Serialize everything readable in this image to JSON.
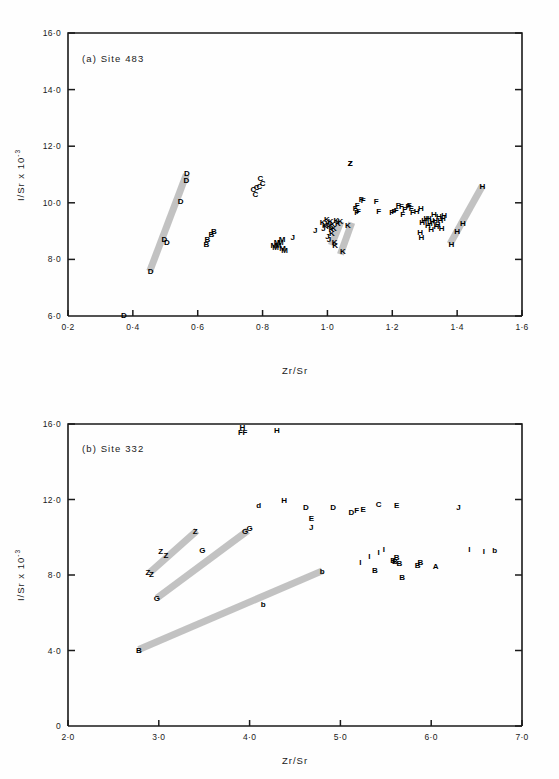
{
  "figure": {
    "background": "#ffffff",
    "ink": "#1a1a1a",
    "band_color": "#bdbdbd"
  },
  "panels": [
    {
      "id": "a",
      "title": "(a)  Site 483",
      "xlabel": "Zr/Sr",
      "ylabel_main": "I/Sr x 10",
      "ylabel_exp": "-3",
      "xticks": [
        "0·2",
        "0·4",
        "0·6",
        "0·8",
        "1·0",
        "1·2",
        "1·4",
        "1·6"
      ],
      "xtickvals": [
        0.2,
        0.4,
        0.6,
        0.8,
        1.0,
        1.2,
        1.4,
        1.6
      ],
      "yticks": [
        "6·0",
        "8·0",
        "10·0",
        "12·0",
        "14·0",
        "16·0"
      ],
      "ytickvals": [
        6,
        8,
        10,
        12,
        14,
        16
      ]
    },
    {
      "id": "b",
      "title": "(b)  Site 332",
      "xlabel": "Zr/Sr",
      "ylabel_main": "I/Sr x 10",
      "ylabel_exp": "-3",
      "xticks": [
        "2·0",
        "3·0",
        "4·0",
        "5·0",
        "6·0",
        "7·0"
      ],
      "xtickvals": [
        2,
        3,
        4,
        5,
        6,
        7
      ],
      "yticks": [
        "0",
        "4·0",
        "8·0",
        "12·0",
        "16·0"
      ],
      "ytickvals": [
        0,
        4,
        8,
        12,
        16
      ]
    }
  ],
  "chart_data": [
    {
      "type": "scatter",
      "title": "(a)  Site 483",
      "xlabel": "Zr/Sr",
      "ylabel": "I/Sr x 10^-3",
      "xlim": [
        0.2,
        1.6
      ],
      "ylim": [
        6.0,
        16.0
      ],
      "grid": false,
      "legend": "none",
      "marker_style": "letter-labels",
      "annotations": [
        {
          "label": "Z",
          "x": 1.07,
          "y": 11.42,
          "note": "isolated high point"
        }
      ],
      "bands": [
        {
          "name": "D-trend",
          "x1": 0.452,
          "y1": 7.58,
          "x2": 0.565,
          "y2": 11.0
        },
        {
          "name": "K-trend-1",
          "x1": 1.012,
          "y1": 8.5,
          "x2": 1.042,
          "y2": 9.35
        },
        {
          "name": "K-trend-2",
          "x1": 1.04,
          "y1": 8.18,
          "x2": 1.075,
          "y2": 9.3
        },
        {
          "name": "H-trend",
          "x1": 1.378,
          "y1": 8.55,
          "x2": 1.478,
          "y2": 10.6
        }
      ],
      "series": [
        {
          "name": "D",
          "points": [
            [
              0.455,
              7.58
            ],
            [
              0.497,
              8.72
            ],
            [
              0.505,
              8.62
            ],
            [
              0.547,
              10.05
            ],
            [
              0.565,
              10.82
            ],
            [
              0.567,
              11.05
            ],
            [
              0.372,
              6.02
            ]
          ]
        },
        {
          "name": "B",
          "points": [
            [
              0.627,
              8.55
            ],
            [
              0.63,
              8.72
            ],
            [
              0.642,
              8.88
            ],
            [
              0.65,
              9.0
            ]
          ]
        },
        {
          "name": "C",
          "points": [
            [
              0.772,
              10.48
            ],
            [
              0.778,
              10.3
            ],
            [
              0.782,
              10.55
            ],
            [
              0.79,
              10.58
            ],
            [
              0.793,
              10.88
            ],
            [
              0.8,
              10.7
            ]
          ]
        },
        {
          "name": "M",
          "points": [
            [
              0.835,
              8.52
            ],
            [
              0.84,
              8.45
            ],
            [
              0.845,
              8.6
            ],
            [
              0.848,
              8.5
            ],
            [
              0.855,
              8.62
            ],
            [
              0.86,
              8.72
            ],
            [
              0.862,
              8.4
            ],
            [
              0.868,
              8.33
            ]
          ]
        },
        {
          "name": "J",
          "points": [
            [
              0.893,
              8.8
            ],
            [
              0.962,
              9.05
            ],
            [
              0.988,
              9.12
            ],
            [
              1.0,
              8.82
            ],
            [
              1.005,
              8.72
            ]
          ]
        },
        {
          "name": "K",
          "points": [
            [
              0.985,
              9.32
            ],
            [
              0.992,
              9.2
            ],
            [
              0.998,
              9.42
            ],
            [
              1.002,
              9.3
            ],
            [
              1.006,
              9.18
            ],
            [
              1.01,
              9.35
            ],
            [
              1.012,
              9.08
            ],
            [
              1.014,
              8.95
            ],
            [
              1.016,
              9.25
            ],
            [
              1.02,
              9.12
            ],
            [
              1.022,
              8.62
            ],
            [
              1.024,
              8.52
            ],
            [
              1.028,
              9.38
            ],
            [
              1.032,
              9.3
            ],
            [
              1.04,
              9.35
            ],
            [
              1.048,
              8.28
            ],
            [
              1.063,
              9.22
            ]
          ]
        },
        {
          "name": "F",
          "points": [
            [
              1.086,
              9.8
            ],
            [
              1.09,
              9.68
            ],
            [
              1.092,
              9.92
            ],
            [
              1.096,
              9.72
            ],
            [
              1.104,
              10.12
            ],
            [
              1.11,
              10.1
            ],
            [
              1.15,
              10.08
            ],
            [
              1.158,
              9.72
            ],
            [
              1.198,
              9.68
            ],
            [
              1.205,
              9.7
            ],
            [
              1.212,
              9.75
            ],
            [
              1.218,
              9.92
            ],
            [
              1.228,
              9.88
            ],
            [
              1.232,
              9.62
            ],
            [
              1.238,
              9.78
            ],
            [
              1.248,
              9.88
            ],
            [
              1.252,
              9.92
            ],
            [
              1.258,
              9.8
            ],
            [
              1.262,
              9.68
            ]
          ]
        },
        {
          "name": "H",
          "points": [
            [
              1.275,
              9.7
            ],
            [
              1.288,
              9.82
            ],
            [
              1.292,
              9.32
            ],
            [
              1.298,
              9.38
            ],
            [
              1.305,
              9.45
            ],
            [
              1.31,
              9.22
            ],
            [
              1.312,
              9.48
            ],
            [
              1.316,
              9.28
            ],
            [
              1.32,
              9.08
            ],
            [
              1.324,
              9.35
            ],
            [
              1.328,
              9.62
            ],
            [
              1.332,
              9.4
            ],
            [
              1.336,
              9.18
            ],
            [
              1.34,
              9.25
            ],
            [
              1.344,
              9.52
            ],
            [
              1.348,
              9.4
            ],
            [
              1.352,
              9.12
            ],
            [
              1.356,
              9.45
            ],
            [
              1.36,
              9.58
            ],
            [
              1.286,
              8.98
            ],
            [
              1.29,
              8.78
            ],
            [
              1.382,
              8.55
            ],
            [
              1.4,
              9.0
            ],
            [
              1.418,
              9.28
            ],
            [
              1.478,
              10.6
            ]
          ]
        },
        {
          "name": "Z",
          "points": [
            [
              1.07,
              11.42
            ]
          ]
        }
      ]
    },
    {
      "type": "scatter",
      "title": "(b)  Site 332",
      "xlabel": "Zr/Sr",
      "ylabel": "I/Sr x 10^-3",
      "xlim": [
        2.0,
        7.0
      ],
      "ylim": [
        0,
        16.0
      ],
      "grid": false,
      "legend": "none",
      "marker_style": "letter-labels",
      "bands": [
        {
          "name": "Z-trend",
          "x1": 2.9,
          "y1": 8.12,
          "x2": 3.42,
          "y2": 10.35
        },
        {
          "name": "G-trend",
          "x1": 2.98,
          "y1": 6.78,
          "x2": 3.98,
          "y2": 10.35
        },
        {
          "name": "B-b-trend",
          "x1": 2.78,
          "y1": 4.05,
          "x2": 4.8,
          "y2": 8.22
        }
      ],
      "series": [
        {
          "name": "H",
          "points": [
            [
              3.92,
              15.85
            ],
            [
              4.3,
              15.7
            ]
          ]
        },
        {
          "name": "F",
          "points": [
            [
              3.9,
              15.55
            ],
            [
              3.95,
              15.58
            ]
          ]
        },
        {
          "name": "d",
          "points": [
            [
              4.1,
              11.7
            ]
          ]
        },
        {
          "name": "H2",
          "letter": "H",
          "points": [
            [
              4.38,
              12.0
            ]
          ]
        },
        {
          "name": "D",
          "points": [
            [
              4.62,
              11.62
            ],
            [
              4.92,
              11.58
            ],
            [
              5.12,
              11.35
            ]
          ]
        },
        {
          "name": "E",
          "points": [
            [
              4.68,
              11.02
            ],
            [
              5.25,
              11.52
            ],
            [
              5.62,
              11.7
            ]
          ]
        },
        {
          "name": "J",
          "points": [
            [
              4.68,
              10.55
            ],
            [
              6.3,
              11.58
            ]
          ]
        },
        {
          "name": "F2",
          "letter": "F",
          "points": [
            [
              5.18,
              11.45
            ]
          ]
        },
        {
          "name": "C",
          "points": [
            [
              5.42,
              11.78
            ]
          ]
        },
        {
          "name": "G",
          "points": [
            [
              2.98,
              6.78
            ],
            [
              3.48,
              9.3
            ],
            [
              3.95,
              10.32
            ],
            [
              4.0,
              10.48
            ]
          ]
        },
        {
          "name": "Z",
          "points": [
            [
              2.88,
              8.18
            ],
            [
              2.92,
              8.05
            ],
            [
              3.02,
              9.28
            ],
            [
              3.08,
              9.05
            ],
            [
              3.4,
              10.35
            ]
          ]
        },
        {
          "name": "B",
          "points": [
            [
              2.78,
              4.05
            ],
            [
              5.38,
              8.25
            ],
            [
              5.58,
              8.82
            ],
            [
              5.6,
              8.72
            ],
            [
              5.62,
              8.98
            ],
            [
              5.65,
              8.62
            ],
            [
              5.68,
              7.92
            ],
            [
              5.85,
              8.52
            ],
            [
              5.88,
              8.68
            ]
          ]
        },
        {
          "name": "b",
          "points": [
            [
              4.15,
              6.45
            ],
            [
              4.8,
              8.22
            ],
            [
              6.7,
              9.35
            ]
          ]
        },
        {
          "name": "I",
          "points": [
            [
              5.22,
              8.68
            ],
            [
              5.32,
              9.02
            ],
            [
              5.42,
              9.22
            ],
            [
              5.48,
              9.38
            ],
            [
              6.42,
              9.38
            ],
            [
              6.58,
              9.28
            ]
          ]
        },
        {
          "name": "A",
          "points": [
            [
              6.05,
              8.48
            ]
          ]
        }
      ]
    }
  ]
}
